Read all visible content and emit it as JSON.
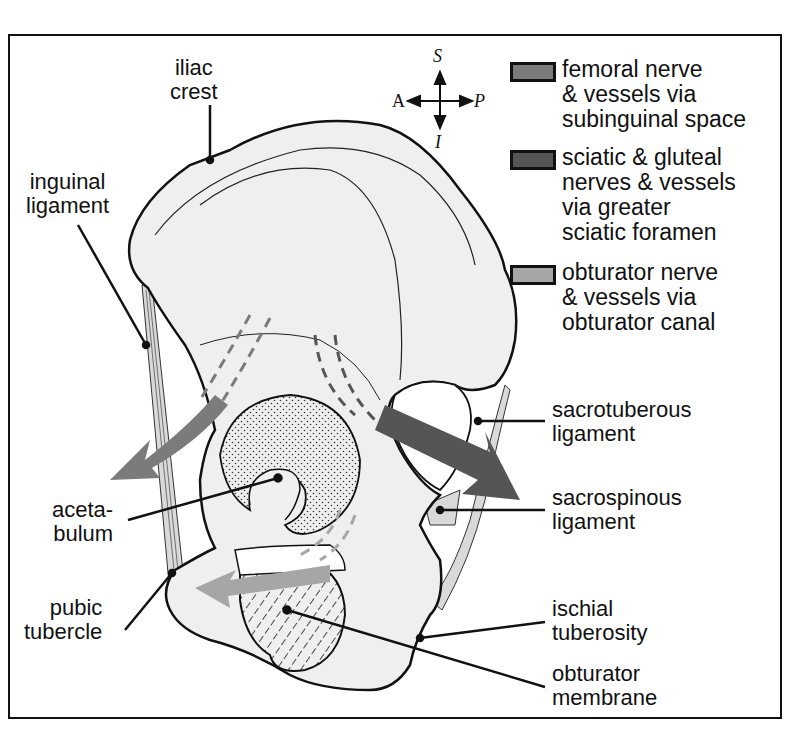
{
  "diagram": {
    "compass": {
      "superior": "S",
      "inferior": "I",
      "anterior": "A",
      "posterior": "P"
    },
    "legend": [
      {
        "label": "femoral nerve\n& vessels via\nsubinguinal space",
        "color": "#7b7b7b"
      },
      {
        "label": "sciatic & gluteal\nnerves & vessels\nvia greater\nsciatic foramen",
        "color": "#555555"
      },
      {
        "label": "obturator nerve\n& vessels via\nobturator canal",
        "color": "#a6a6a6"
      }
    ],
    "labels": {
      "iliac_crest": "iliac\ncrest",
      "inguinal_ligament": "inguinal\nligament",
      "acetabulum": "aceta-\nbulum",
      "pubic_tubercle": "pubic\ntubercle",
      "sacrotuberous_ligament": "sacrotuberous\nligament",
      "sacrospinous_ligament": "sacrospinous\nligament",
      "ischial_tuberosity": "ischial\ntuberosity",
      "obturator_membrane": "obturator\nmembrane"
    },
    "colors": {
      "bone_fill": "#efefef",
      "outline": "#111111",
      "ligament_fill": "#d9d9d9",
      "femoral_arrow": "#7b7b7b",
      "sciatic_arrow": "#555555",
      "obturator_arrow": "#a6a6a6"
    }
  }
}
